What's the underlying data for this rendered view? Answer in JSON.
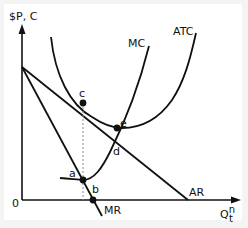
{
  "diagram": {
    "type": "monopoly cost/revenue diagram",
    "y_axis_label": "$P, C",
    "x_axis_label": "Q",
    "x_axis_sup": "n",
    "x_axis_sub": "t",
    "origin_label": "0",
    "curves": {
      "mc": "MC",
      "atc": "ATC",
      "ar": "AR",
      "mr": "MR"
    },
    "points": {
      "a": "a",
      "b": "b",
      "c": "c",
      "d": "d",
      "e": "e"
    },
    "colors": {
      "line": "#111111",
      "background": "#ffffff",
      "dashed": "#888888"
    }
  }
}
